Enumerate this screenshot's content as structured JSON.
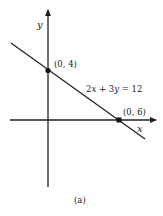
{
  "figure": {
    "caption": "(a)",
    "axes": {
      "x_label": "x",
      "y_label": "y"
    },
    "line": {
      "equation": "2x + 3y = 12",
      "equation_parts": [
        "2",
        "x",
        " + 3",
        "y",
        " = 12"
      ]
    },
    "points": [
      {
        "label": "(0, 4)",
        "note": "y-intercept"
      },
      {
        "label": "(0, 6)",
        "note": "x-intercept (as printed; mathematically (6, 0))"
      }
    ],
    "colors": {
      "ink": "#222222",
      "background": "#ffffff"
    }
  }
}
